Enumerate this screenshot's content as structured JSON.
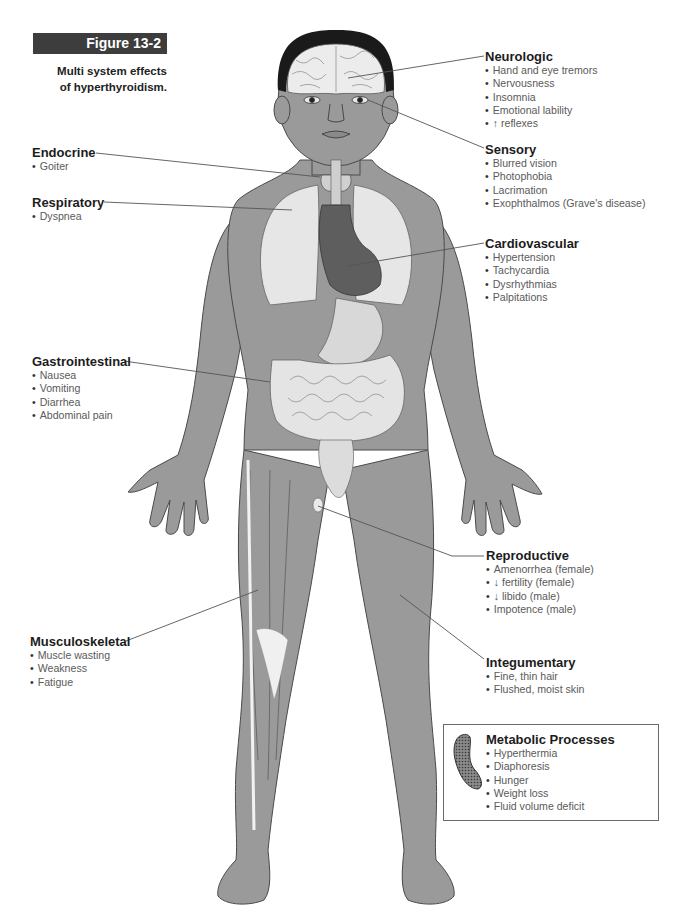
{
  "figure": {
    "label": "Figure 13-2",
    "caption_line1": "Multi system effects",
    "caption_line2": "of hyperthyroidism."
  },
  "colors": {
    "banner_bg": "#3d3d3d",
    "skin": "#9a9a9a",
    "skin_outline": "#4a4a4a",
    "organ_light": "#e6e6e6",
    "organ_dark": "#5e5e5e",
    "hair": "#1a1a1a",
    "leader_line": "#555555"
  },
  "groups": {
    "neurologic": {
      "title": "Neurologic",
      "items": [
        "Hand and eye tremors",
        "Nervousness",
        "Insomnia",
        "Emotional lability",
        "↑ reflexes"
      ]
    },
    "sensory": {
      "title": "Sensory",
      "items": [
        "Blurred vision",
        "Photophobia",
        "Lacrimation",
        "Exophthalmos (Grave's disease)"
      ]
    },
    "endocrine": {
      "title": "Endocrine",
      "items": [
        "Goiter"
      ]
    },
    "respiratory": {
      "title": "Respiratory",
      "items": [
        "Dyspnea"
      ]
    },
    "cardiovascular": {
      "title": "Cardiovascular",
      "items": [
        "Hypertension",
        "Tachycardia",
        "Dysrhythmias",
        "Palpitations"
      ]
    },
    "gastrointestinal": {
      "title": "Gastrointestinal",
      "items": [
        "Nausea",
        "Vomiting",
        "Diarrhea",
        "Abdominal pain"
      ]
    },
    "reproductive": {
      "title": "Reproductive",
      "items": [
        "Amenorrhea (female)",
        "↓ fertility (female)",
        "↓ libido (male)",
        "Impotence (male)"
      ]
    },
    "integumentary": {
      "title": "Integumentary",
      "items": [
        "Fine, thin hair",
        "Flushed, moist skin"
      ]
    },
    "musculoskeletal": {
      "title": "Musculoskeletal",
      "items": [
        "Muscle wasting",
        "Weakness",
        "Fatigue"
      ]
    },
    "metabolic": {
      "title": "Metabolic Processes",
      "items": [
        "Hyperthermia",
        "Diaphoresis",
        "Hunger",
        "Weight loss",
        "Fluid volume deficit"
      ],
      "icon": "mitochondrion-icon"
    }
  }
}
